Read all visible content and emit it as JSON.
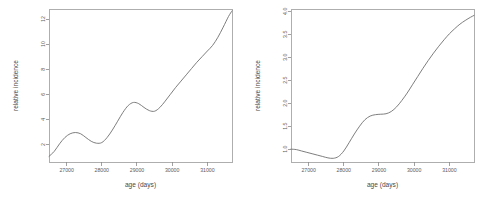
{
  "figure": {
    "background_color": "#ffffff",
    "line_color": "#6f6f6f",
    "axis_color": "#8a8a8a",
    "panel_count": 2
  },
  "chart_data": [
    {
      "type": "line",
      "panel": "left",
      "title": "",
      "xlabel": "age (days)",
      "ylabel": "relative incidence",
      "xlim": [
        26500,
        31700
      ],
      "ylim": [
        0.6,
        12.8
      ],
      "grid": false,
      "legend": null,
      "xticks": [
        27000,
        28000,
        29000,
        30000,
        31000
      ],
      "xticklabels": [
        "27000",
        "28000",
        "29000",
        "30000",
        "31000"
      ],
      "yticks": [
        2,
        4,
        6,
        8,
        10,
        12
      ],
      "yticklabels": [
        "2",
        "4",
        "6",
        "8",
        "10",
        "12"
      ],
      "x": [
        26500,
        26650,
        26800,
        26950,
        27100,
        27250,
        27400,
        27550,
        27700,
        27850,
        28000,
        28150,
        28300,
        28450,
        28600,
        28750,
        28900,
        29050,
        29200,
        29350,
        29500,
        29650,
        29800,
        29950,
        30100,
        30250,
        30400,
        30550,
        30700,
        30850,
        31000,
        31150,
        31300,
        31450,
        31600,
        31700
      ],
      "y": [
        1.05,
        1.45,
        2.05,
        2.55,
        2.85,
        2.95,
        2.85,
        2.55,
        2.25,
        2.1,
        2.15,
        2.55,
        3.15,
        3.85,
        4.55,
        5.1,
        5.35,
        5.25,
        4.95,
        4.7,
        4.65,
        4.95,
        5.45,
        6.0,
        6.55,
        7.05,
        7.55,
        8.05,
        8.55,
        9.0,
        9.45,
        9.9,
        10.55,
        11.35,
        12.2,
        12.65
      ]
    },
    {
      "type": "line",
      "panel": "right",
      "title": "",
      "xlabel": "age (days)",
      "ylabel": "relative incidence",
      "xlim": [
        26500,
        31700
      ],
      "ylim": [
        0.72,
        4.05
      ],
      "grid": false,
      "legend": null,
      "xticks": [
        27000,
        28000,
        29000,
        30000,
        31000
      ],
      "xticklabels": [
        "27000",
        "28000",
        "29000",
        "30000",
        "31000"
      ],
      "yticks": [
        1.0,
        1.5,
        2.0,
        2.5,
        3.0,
        3.5,
        4.0
      ],
      "yticklabels": [
        "1.0",
        "1.5",
        "2.0",
        "2.5",
        "3.0",
        "3.5",
        "4.0"
      ],
      "x": [
        26500,
        26650,
        26800,
        26950,
        27100,
        27250,
        27400,
        27550,
        27700,
        27850,
        28000,
        28150,
        28300,
        28450,
        28600,
        28750,
        28900,
        29050,
        29200,
        29350,
        29500,
        29650,
        29800,
        29950,
        30100,
        30250,
        30400,
        30550,
        30700,
        30850,
        31000,
        31150,
        31300,
        31450,
        31600,
        31700
      ],
      "y": [
        1.0,
        0.99,
        0.96,
        0.93,
        0.9,
        0.87,
        0.84,
        0.81,
        0.8,
        0.84,
        0.96,
        1.14,
        1.33,
        1.5,
        1.64,
        1.72,
        1.75,
        1.76,
        1.77,
        1.82,
        1.92,
        2.06,
        2.22,
        2.4,
        2.58,
        2.76,
        2.93,
        3.09,
        3.24,
        3.38,
        3.51,
        3.62,
        3.72,
        3.8,
        3.87,
        3.91
      ]
    }
  ],
  "panels": [
    {
      "name": "left-panel",
      "xlabel": "age (days)",
      "ylabel": "relative incidence"
    },
    {
      "name": "right-panel",
      "xlabel": "age (days)",
      "ylabel": "relative incidence"
    }
  ]
}
